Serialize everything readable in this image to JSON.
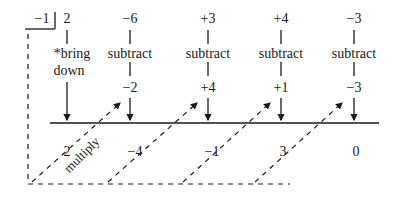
{
  "divisor": "−1",
  "coefficients": [
    "2",
    "−6",
    "+3",
    "+4",
    "−3"
  ],
  "first_col_label": [
    "*bring",
    "down"
  ],
  "step_label": "subtract",
  "products": [
    "−2",
    "+4",
    "+1",
    "−3"
  ],
  "results": [
    "2",
    "−4",
    "−1",
    "3",
    "0"
  ],
  "multiply_label": "multiply",
  "colors": {
    "ink": "#1a1a1a",
    "background": "#ffffff"
  }
}
